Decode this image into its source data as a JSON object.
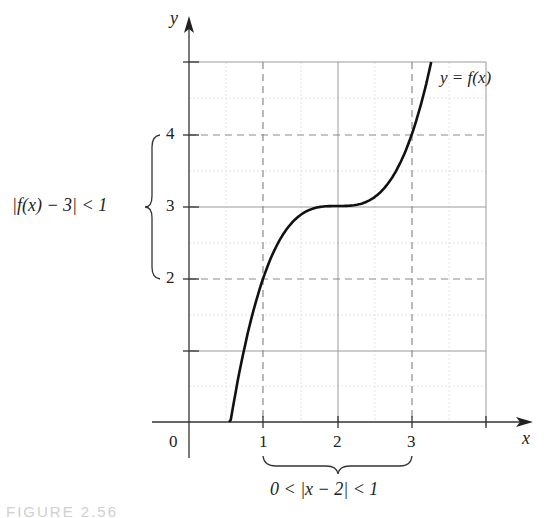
{
  "chart_data": {
    "type": "line",
    "title": "",
    "xlabel": "x",
    "ylabel": "y",
    "xlim": [
      -0.5,
      4.6
    ],
    "ylim": [
      -0.4,
      5.5
    ],
    "x_ticks": [
      1,
      2,
      3,
      4
    ],
    "x_tick_labels": [
      "1",
      "2",
      "3",
      ""
    ],
    "y_ticks": [
      1,
      2,
      3,
      4,
      5
    ],
    "y_tick_labels": [
      "",
      "2",
      "3",
      "4",
      ""
    ],
    "origin_label": "0",
    "grid": true,
    "minor_grid": true,
    "series": [
      {
        "name": "y = f(x)",
        "function": "f(x) = 3 + (x - 2)^3",
        "x": [
          0.54,
          0.75,
          1.0,
          1.25,
          1.5,
          1.75,
          2.0,
          2.25,
          2.5,
          2.75,
          3.0,
          3.15,
          3.26
        ],
        "values": [
          -0.1,
          1.05,
          2.0,
          2.58,
          2.88,
          2.98,
          3.0,
          3.02,
          3.13,
          3.42,
          4.0,
          4.52,
          5.0
        ]
      }
    ],
    "dashed_reference_lines": {
      "vertical": [
        1,
        3
      ],
      "horizontal": [
        2,
        4
      ]
    },
    "annotations": [
      {
        "text": "y = f(x)",
        "position": "top-right near curve"
      },
      {
        "text": "|f(x) − 3| < 1",
        "position": "left brace spanning y 2 to 4"
      },
      {
        "text": "0 < |x − 2| < 1",
        "position": "bottom brace spanning x 1 to 3"
      }
    ]
  },
  "labels": {
    "y_axis": "y",
    "x_axis": "x",
    "origin": "0",
    "x1": "1",
    "x2": "2",
    "x3": "3",
    "y2": "2",
    "y3": "3",
    "y4": "4",
    "curve": "y = f(x)",
    "y_interval": "|f(x) − 3| < 1",
    "x_interval": "0 < |x − 2| < 1",
    "caption": "FIGURE 2.56"
  }
}
